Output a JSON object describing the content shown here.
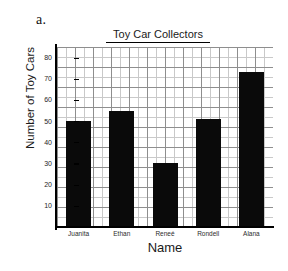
{
  "part_label": "a.",
  "chart_data": {
    "type": "bar",
    "title": "Toy Car Collectors",
    "xlabel": "Name",
    "ylabel": "Number of Toy Cars",
    "categories": [
      "Juanita",
      "Ethan",
      "Reneé",
      "Rondell",
      "Alana"
    ],
    "values": [
      50,
      55,
      30,
      51,
      73
    ],
    "ylim": [
      0,
      85
    ],
    "ytick_labels": [
      "10",
      "20",
      "30",
      "40",
      "50",
      "60",
      "70",
      "80"
    ],
    "ytick_values": [
      10,
      20,
      30,
      40,
      50,
      60,
      70,
      80
    ],
    "grid": true,
    "legend": "none",
    "bar_color": "#0a0a0a",
    "grid_color": "#c9c9c9",
    "grid_major_color": "#8e8e8e",
    "axis_color": "#000000"
  }
}
